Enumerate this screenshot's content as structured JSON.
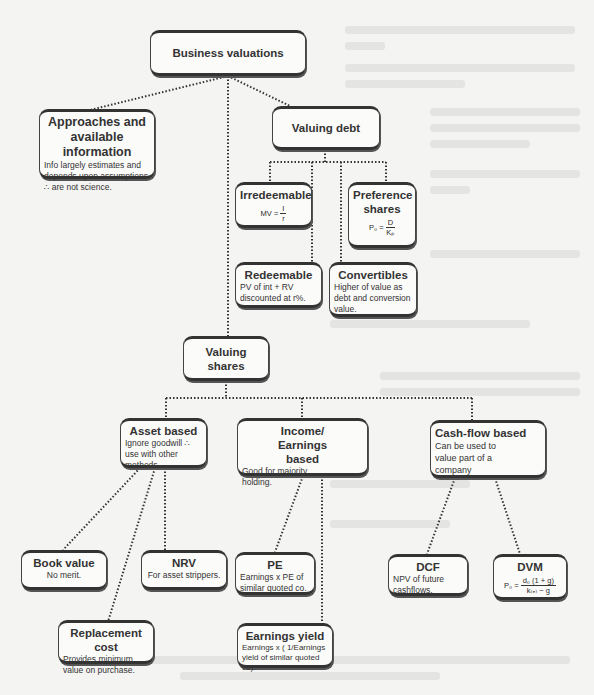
{
  "diagram": {
    "type": "tree",
    "colors": {
      "background": "#f4f4f2",
      "box_border": "#333333",
      "box_fill": "#fbfbfa",
      "connector": "#333333"
    },
    "root": {
      "title": "Business valuations"
    },
    "approaches": {
      "title": "Approaches and available information",
      "desc": "Info largely estimates and depends upon assumptions ∴ are not science."
    },
    "valuing_debt": {
      "title": "Valuing debt",
      "irredeemable": {
        "title": "Irredeemable",
        "formula_lhs": "MV =",
        "formula_num": "I",
        "formula_den": "r"
      },
      "preference_shares": {
        "title": "Preference shares",
        "formula_lhs": "P₀ =",
        "formula_num": "D",
        "formula_den": "Kₚ"
      },
      "redeemable": {
        "title": "Redeemable",
        "desc": "PV of int + RV discounted at r%."
      },
      "convertibles": {
        "title": "Convertibles",
        "desc": "Higher of value as debt and conversion value."
      }
    },
    "valuing_shares": {
      "title": "Valuing shares",
      "asset_based": {
        "title": "Asset based",
        "desc": "Ignore goodwill ∴ use with other methods.",
        "children": {
          "book_value": {
            "title": "Book value",
            "desc": "No merit."
          },
          "nrv": {
            "title": "NRV",
            "desc": "For asset strippers."
          },
          "replacement_cost": {
            "title": "Replacement cost",
            "desc": "Provides minimum value on purchase."
          }
        }
      },
      "income_based": {
        "title": "Income/ Earnings based",
        "desc": "Good for majority holding.",
        "children": {
          "pe": {
            "title": "PE",
            "desc": "Earnings x PE of similar quoted co."
          },
          "earnings_yield": {
            "title": "Earnings yield",
            "desc": "Earnings x ( 1/Earnings yield of similar quoted co)."
          }
        }
      },
      "cashflow_based": {
        "title": "Cash-flow based",
        "desc": "Can be used to value part of a company",
        "children": {
          "dcf": {
            "title": "DCF",
            "desc": "NPV of future cashflows."
          },
          "dvm": {
            "title": "DVM",
            "formula_lhs": "P₀ =",
            "formula_num": "d₀ (1 + g)",
            "formula_den": "k₍ₑ₎ − g"
          }
        }
      }
    }
  }
}
